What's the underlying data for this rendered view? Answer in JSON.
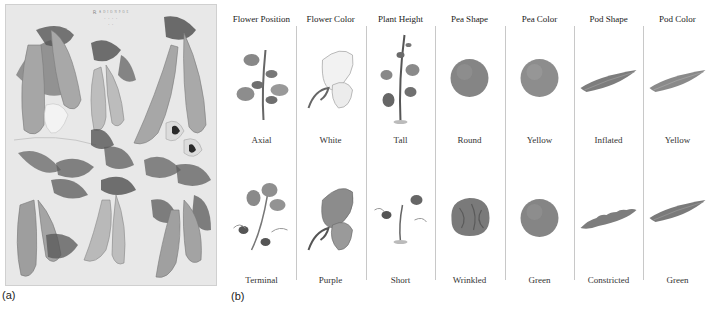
{
  "panel_a": {
    "label": "(a)",
    "plate_title_lines": [
      "Ꭱ ᴬ ᴰ ᴵ ᴼ ᴺ ᴾ ᴼ ᴱ",
      "· · · ·",
      "· ·"
    ],
    "description": "Botanical illustration plate of pea plants: pods, leaves, flowers"
  },
  "panel_b": {
    "label": "(b)",
    "columns": [
      {
        "header": "Flower Position",
        "dominant": "Axial",
        "recessive": "Terminal",
        "dom_icon": "axial-flower-plant-icon",
        "rec_icon": "terminal-flower-plant-icon"
      },
      {
        "header": "Flower Color",
        "dominant": "White",
        "recessive": "Purple",
        "dom_icon": "white-flower-icon",
        "rec_icon": "purple-flower-icon"
      },
      {
        "header": "Plant Height",
        "dominant": "Tall",
        "recessive": "Short",
        "dom_icon": "tall-plant-icon",
        "rec_icon": "short-plant-icon"
      },
      {
        "header": "Pea Shape",
        "dominant": "Round",
        "recessive": "Wrinkled",
        "dom_icon": "round-pea-icon",
        "rec_icon": "wrinkled-pea-icon"
      },
      {
        "header": "Pea Color",
        "dominant": "Yellow",
        "recessive": "Green",
        "dom_icon": "yellow-pea-icon",
        "rec_icon": "green-pea-icon"
      },
      {
        "header": "Pod Shape",
        "dominant": "Inflated",
        "recessive": "Constricted",
        "dom_icon": "inflated-pod-icon",
        "rec_icon": "constricted-pod-icon"
      },
      {
        "header": "Pod Color",
        "dominant": "Yellow",
        "recessive": "Green",
        "dom_icon": "yellow-pod-icon",
        "rec_icon": "green-pod-icon"
      }
    ]
  },
  "colors": {
    "plate_bg": "#e8e8e8",
    "pod": "#9a9a9a",
    "leaf": "#6e6e6e",
    "pea": "#8a8a8a",
    "divider": "#c8c8c8"
  }
}
